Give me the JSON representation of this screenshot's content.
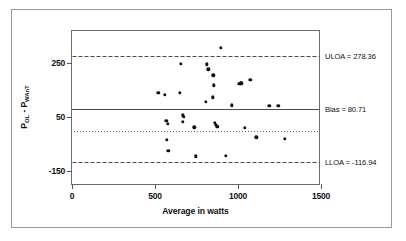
{
  "figure": {
    "background_color": "#ffffff",
    "frame_color": "#9a9a9a",
    "axis_color": "#6d6d6d",
    "point_color": "#111111"
  },
  "chart_data": {
    "type": "scatter",
    "title": "",
    "subtitle": "",
    "xlabel": "Average in watts",
    "ylabel_prefix": "P",
    "ylabel_sub1": "OL",
    "ylabel_mid": " - P",
    "ylabel_sub2": "WAnT",
    "ylabel_plain": "P(OL) - P(WAnT)",
    "xlim": [
      0,
      1500
    ],
    "ylim": [
      -205,
      370
    ],
    "xticks": [
      0,
      500,
      1000,
      1500
    ],
    "xtick_labels": [
      "0",
      "500",
      "1000",
      "1500"
    ],
    "yticks": [
      250,
      50,
      -150
    ],
    "ytick_labels": [
      "250",
      "50",
      "-150"
    ],
    "grid": false,
    "legend_position": "right-outside-inline",
    "reference_lines": [
      {
        "name": "uloa",
        "label": "ULOA = 278.36",
        "value": 278.36,
        "style": "dashed"
      },
      {
        "name": "bias",
        "label": "Bias = 80.71",
        "value": 80.71,
        "style": "solid"
      },
      {
        "name": "zero",
        "label": "",
        "value": 0,
        "style": "dotted"
      },
      {
        "name": "lloa",
        "label": "LLOA = -116.94",
        "value": -116.94,
        "style": "dashed"
      }
    ],
    "series": [
      {
        "name": "OL vs WAnT difference",
        "points": [
          [
            520,
            141
          ],
          [
            560,
            134
          ],
          [
            567,
            36
          ],
          [
            577,
            25
          ],
          [
            571,
            -33
          ],
          [
            579,
            -75
          ],
          [
            648,
            141
          ],
          [
            657,
            248
          ],
          [
            668,
            57
          ],
          [
            672,
            51
          ],
          [
            667,
            34
          ],
          [
            737,
            13
          ],
          [
            744,
            -95
          ],
          [
            805,
            107
          ],
          [
            812,
            247
          ],
          [
            822,
            228
          ],
          [
            852,
            205
          ],
          [
            848,
            124
          ],
          [
            855,
            168
          ],
          [
            862,
            30
          ],
          [
            866,
            22
          ],
          [
            872,
            17
          ],
          [
            878,
            14
          ],
          [
            896,
            308
          ],
          [
            925,
            -92
          ],
          [
            963,
            95
          ],
          [
            1007,
            175
          ],
          [
            1016,
            176
          ],
          [
            1021,
            176
          ],
          [
            1040,
            11
          ],
          [
            1073,
            190
          ],
          [
            1110,
            -25
          ],
          [
            1188,
            92
          ],
          [
            1243,
            92
          ],
          [
            1282,
            -31
          ]
        ]
      }
    ]
  }
}
